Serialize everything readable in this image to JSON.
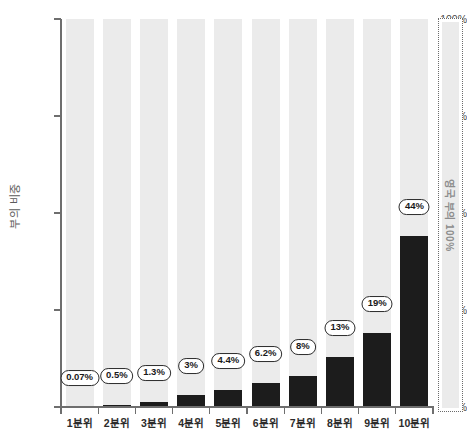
{
  "chart_data": {
    "type": "bar",
    "title": "",
    "subtitle": "",
    "xlabel": "",
    "ylabel": "부의 비중",
    "categories": [
      "1분위",
      "2분위",
      "3분위",
      "4분위",
      "5분위",
      "6분위",
      "7분위",
      "8분위",
      "9분위",
      "10분위"
    ],
    "values": [
      0.07,
      0.5,
      1.3,
      3,
      4.4,
      6.2,
      8,
      13,
      19,
      44
    ],
    "data_labels": [
      "0.07%",
      "0.5%",
      "1.3%",
      "3%",
      "4.4%",
      "6.2%",
      "8%",
      "13%",
      "19%",
      "44%"
    ],
    "ylim": [
      0,
      100
    ],
    "ytick_values": [
      0,
      25,
      50,
      75,
      100
    ],
    "ytick_labels": [
      "0%",
      "25%",
      "50%",
      "75%",
      "100%"
    ],
    "grid": false,
    "legend": "none",
    "bar_color": "#1c1c1c",
    "track_color": "#ebebeb",
    "axis_color": "#6e6e6e",
    "label_pill_fill": "#ffffff",
    "label_pill_border": "#2b2b2b"
  },
  "annotation": {
    "text": "영국 부의 100%",
    "border_style": "dotted",
    "border_color": "#6b6b6b",
    "text_color": "#8d8d8d"
  }
}
